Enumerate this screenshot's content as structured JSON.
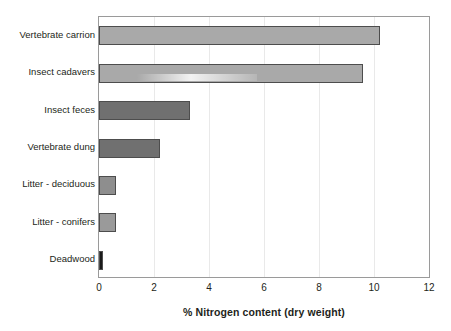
{
  "chart_data": {
    "type": "bar",
    "orientation": "horizontal",
    "title": "",
    "xlabel": "% Nitrogen content (dry weight)",
    "ylabel": "",
    "xlim": [
      0,
      12
    ],
    "xticks": [
      0,
      2,
      4,
      6,
      8,
      10,
      12
    ],
    "grid": true,
    "grid_axis": "x",
    "legend": null,
    "categories": [
      "Vertebrate carrion",
      "Insect cadavers",
      "Insect feces",
      "Vertebrate dung",
      "Litter - deciduous",
      "Litter - conifers",
      "Deadwood"
    ],
    "values": [
      10.2,
      9.6,
      3.3,
      2.2,
      0.6,
      0.6,
      0.15
    ],
    "bar_colors": [
      "#a9a9a9",
      "#a9a9a9",
      "#707070",
      "#707070",
      "#8e8e8e",
      "#9a9a9a",
      "#1a1a1a"
    ],
    "bar_border_color": "#4d4d4d",
    "plot_border_color": "#9a9a9a",
    "gridline_color": "#e9e9e9",
    "background_color": "#ffffff",
    "text_color": "#231f20"
  }
}
